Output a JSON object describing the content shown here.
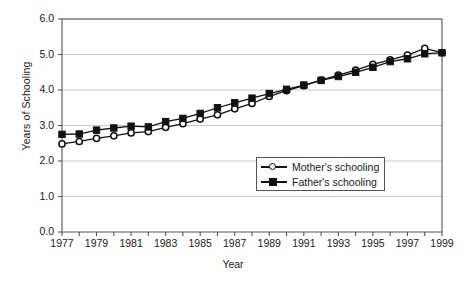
{
  "chart_data": {
    "type": "line",
    "title": "",
    "xlabel": "Year",
    "ylabel": "Years of Schooling",
    "xlim": [
      1977,
      1999
    ],
    "ylim": [
      0.0,
      6.0
    ],
    "grid": true,
    "legend_position": "inside-lower-right",
    "x": [
      1977,
      1978,
      1979,
      1980,
      1981,
      1982,
      1983,
      1984,
      1985,
      1986,
      1987,
      1988,
      1989,
      1990,
      1991,
      1992,
      1993,
      1994,
      1995,
      1996,
      1997,
      1998,
      1999
    ],
    "yticks": [
      "0.0",
      "1.0",
      "2.0",
      "3.0",
      "4.0",
      "5.0",
      "6.0"
    ],
    "xticks": [
      "1977",
      "1979",
      "1981",
      "1983",
      "1985",
      "1987",
      "1989",
      "1991",
      "1993",
      "1995",
      "1997",
      "1999"
    ],
    "series": [
      {
        "name": "Mother's schooling",
        "marker": "open-circle",
        "values": [
          2.48,
          2.55,
          2.64,
          2.71,
          2.79,
          2.83,
          2.95,
          3.05,
          3.18,
          3.3,
          3.47,
          3.62,
          3.82,
          3.98,
          4.12,
          4.28,
          4.42,
          4.56,
          4.72,
          4.85,
          4.98,
          5.17,
          5.05
        ]
      },
      {
        "name": "Father's schooling",
        "marker": "filled-square",
        "values": [
          2.75,
          2.76,
          2.87,
          2.93,
          2.98,
          2.96,
          3.11,
          3.2,
          3.34,
          3.5,
          3.64,
          3.77,
          3.9,
          4.02,
          4.14,
          4.27,
          4.38,
          4.5,
          4.64,
          4.8,
          4.88,
          5.02,
          5.05
        ]
      }
    ]
  },
  "axis": {
    "y_title": "Years of Schooling",
    "x_title": "Year"
  },
  "legend": {
    "items": [
      {
        "label": "Mother's schooling"
      },
      {
        "label": "Father's schooling"
      }
    ]
  },
  "colors": {
    "line": "#111111",
    "grid": "#c9c9c9",
    "axis": "#555555",
    "background": "#ffffff"
  }
}
